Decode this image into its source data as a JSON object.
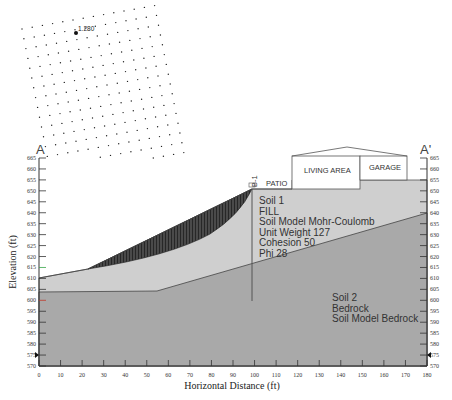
{
  "section": {
    "start_label": "A",
    "end_label": "A'"
  },
  "search_grid": {
    "min_factor_of_safety": "1.280"
  },
  "axes": {
    "x_title": "Horizontal Distance (ft)",
    "y_title": "Elevation (ft)",
    "x_ticks": [
      "0",
      "10",
      "20",
      "30",
      "40",
      "50",
      "60",
      "70",
      "80",
      "90",
      "100",
      "110",
      "120",
      "130",
      "140",
      "150",
      "160",
      "170",
      "180"
    ],
    "y_ticks": [
      "665",
      "660",
      "655",
      "650",
      "645",
      "640",
      "635",
      "630",
      "625",
      "620",
      "615",
      "610",
      "605",
      "600",
      "595",
      "590",
      "585",
      "580",
      "575",
      "570"
    ]
  },
  "boring": {
    "label": "B-1"
  },
  "structures": {
    "patio": "PATIO",
    "living_area": "LIVING AREA",
    "garage": "GARAGE"
  },
  "soil1": {
    "lines": [
      "Soil 1",
      "FILL",
      "Soil Model Mohr-Coulomb",
      "Unit Weight 127",
      "Cohesion 50",
      "Phi 28"
    ]
  },
  "soil2": {
    "lines": [
      "Soil 2",
      "Bedrock",
      "Soil Model Bedrock"
    ]
  },
  "colors": {
    "soil1_fill": "#cfcfcf",
    "soil2_fill": "#a9a9a9",
    "slip_mass": "#3a3a3a",
    "water_tick_green": "#3aa64a",
    "water_tick_red": "#c0392b"
  }
}
